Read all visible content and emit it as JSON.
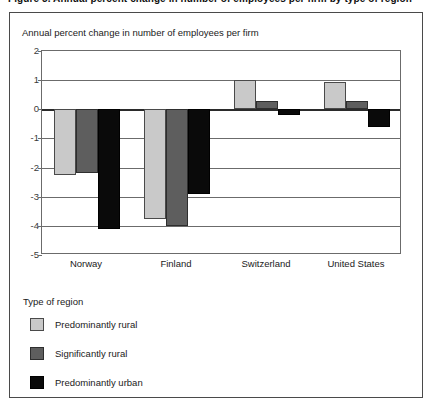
{
  "figure": {
    "title": "Figure 5. Annual percent change in number of employees per firm by type of region",
    "subtitle": "Annual percent change in number of employees per firm"
  },
  "legend": {
    "title": "Type of region",
    "items": [
      {
        "label": "Predominantly rural",
        "color": "#c9c9c9",
        "key": "rural"
      },
      {
        "label": "Significantly rural",
        "color": "#5e5e5e",
        "key": "signif"
      },
      {
        "label": "Predominantly urban",
        "color": "#0a0a0a",
        "key": "urban"
      }
    ]
  },
  "chart_data": {
    "type": "bar",
    "title": "",
    "subtitle": "Annual percent change in number of employees per firm",
    "xlabel": "",
    "ylabel": "Annual percent change in number of employees per firm",
    "categories": [
      "Norway",
      "Finland",
      "Switzerland",
      "United States"
    ],
    "series": [
      {
        "name": "Predominantly rural",
        "color": "#c9c9c9",
        "values": [
          -2.25,
          -3.75,
          1.0,
          0.95
        ]
      },
      {
        "name": "Significantly rural",
        "color": "#5e5e5e",
        "values": [
          -2.2,
          -4.0,
          0.3,
          0.3
        ]
      },
      {
        "name": "Predominantly urban",
        "color": "#0a0a0a",
        "values": [
          -4.1,
          -2.9,
          -0.2,
          -0.6
        ]
      }
    ],
    "ylim": [
      -5,
      2
    ],
    "yticks": [
      2,
      1,
      0,
      -1,
      -2,
      -3,
      -4,
      -5
    ],
    "ytick_labels": [
      "2",
      "1",
      "0",
      "-1",
      "-2",
      "-3",
      "-4",
      "-5"
    ],
    "grid": true,
    "legend_position": "below-plot"
  }
}
